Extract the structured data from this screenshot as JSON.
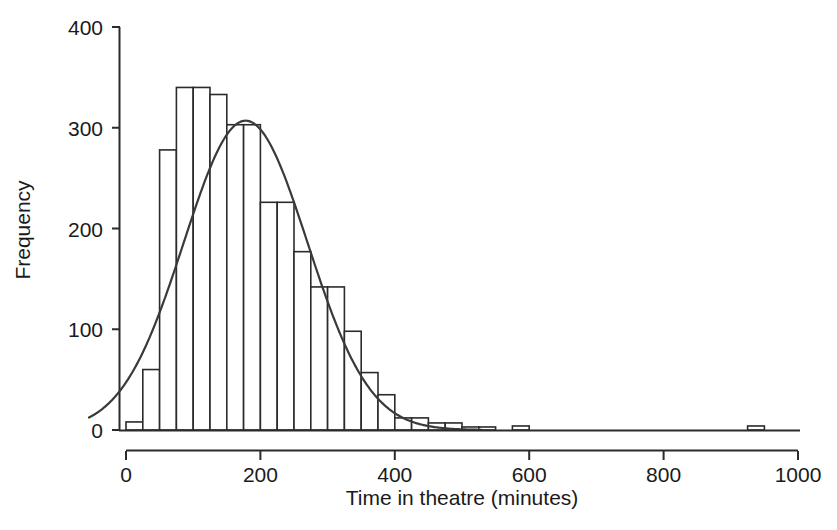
{
  "chart_data": {
    "type": "bar",
    "title": "",
    "subtitle": "",
    "xlabel": "Time in theatre (minutes)",
    "ylabel": "Frequency",
    "xlim": [
      -50,
      1000
    ],
    "ylim": [
      0,
      400
    ],
    "xticks": [
      0,
      200,
      400,
      600,
      800,
      1000
    ],
    "xtick_labels": [
      "0",
      "200",
      "400",
      "600",
      "800",
      "1000"
    ],
    "yticks": [
      0,
      100,
      200,
      300,
      400
    ],
    "ytick_labels": [
      "0",
      "100",
      "200",
      "300",
      "400"
    ],
    "grid": false,
    "legend": false,
    "legend_position": "none",
    "bin_width": 25,
    "bin_starts": [
      0,
      25,
      50,
      75,
      100,
      125,
      150,
      175,
      200,
      225,
      250,
      275,
      300,
      325,
      350,
      375,
      400,
      425,
      450,
      475,
      500,
      525,
      575,
      925
    ],
    "categories": [
      "0-25",
      "25-50",
      "50-75",
      "75-100",
      "100-125",
      "125-150",
      "150-175",
      "175-200",
      "200-225",
      "225-250",
      "250-275",
      "275-300",
      "300-325",
      "325-350",
      "350-375",
      "375-400",
      "400-425",
      "425-450",
      "450-475",
      "475-500",
      "500-525",
      "525-550",
      "575-600",
      "925-950"
    ],
    "values": [
      8,
      60,
      278,
      340,
      340,
      333,
      303,
      303,
      226,
      226,
      177,
      142,
      142,
      98,
      57,
      35,
      12,
      12,
      7,
      7,
      3,
      3,
      4,
      4
    ],
    "series": [
      {
        "name": "Frequency",
        "type": "bar",
        "values": [
          8,
          60,
          278,
          340,
          340,
          333,
          303,
          303,
          226,
          226,
          177,
          142,
          142,
          98,
          57,
          35,
          12,
          12,
          7,
          7,
          3,
          3,
          4,
          4
        ]
      },
      {
        "name": "Normal curve",
        "type": "line",
        "mean": 178,
        "peak_value": 307,
        "std_dev": 92,
        "x": [
          -50,
          0,
          25,
          50,
          75,
          100,
          125,
          150,
          175,
          200,
          225,
          250,
          275,
          300,
          325,
          350,
          375,
          400,
          425,
          450,
          475,
          500,
          1000
        ],
        "values": [
          9,
          28,
          48,
          76,
          113,
          157,
          204,
          250,
          288,
          306,
          300,
          272,
          229,
          178,
          129,
          87,
          54,
          31,
          16,
          8,
          4,
          2,
          0
        ]
      }
    ],
    "colors": {
      "bar_edge": "#2b2b2b",
      "bar_fill": "#ffffff",
      "curve": "#3a3a3a",
      "axis": "#2b2b2b",
      "text": "#1a1a1a"
    }
  },
  "axes": {
    "x_title": "Time in theatre (minutes)",
    "y_title": "Frequency"
  }
}
